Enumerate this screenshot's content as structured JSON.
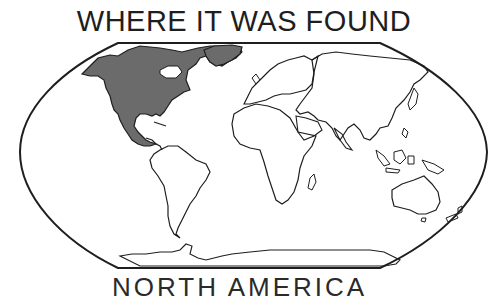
{
  "title": "WHERE IT WAS FOUND",
  "caption_partial": "NORTH AMERICA",
  "map": {
    "projection": "world-map-outline",
    "highlighted_region": "North America",
    "highlight_color": "#6b6b6b",
    "land_stroke": "#1e1e1e",
    "background": "#ffffff"
  }
}
